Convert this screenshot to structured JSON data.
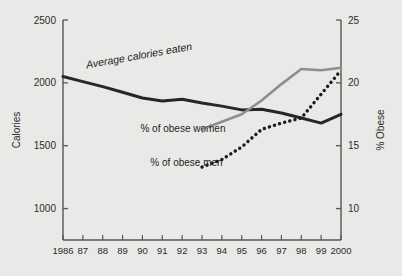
{
  "chart_data": {
    "type": "line",
    "title": "",
    "subtitle": "",
    "xlabel": "",
    "ylabel": "Calories",
    "y2label": "% Obese",
    "grid": false,
    "legend": "inline-annotations",
    "background_color": "#e9e9e7",
    "x": [
      1986,
      1987,
      1988,
      1989,
      1990,
      1991,
      1992,
      1993,
      1994,
      1995,
      1996,
      1997,
      1998,
      1999,
      2000
    ],
    "xtick_labels": [
      "1986",
      "87",
      "88",
      "89",
      "90",
      "91",
      "92",
      "93",
      "94",
      "95",
      "96",
      "97",
      "98",
      "99",
      "2000"
    ],
    "xlim": [
      1986,
      2000
    ],
    "ylim": [
      750,
      2500
    ],
    "ytick_labels": [
      "2500",
      "2000",
      "1500",
      "1000"
    ],
    "yticks": [
      2500,
      2000,
      1500,
      1000
    ],
    "y2lim": [
      7.5,
      25
    ],
    "y2tick_labels": [
      "25",
      "20",
      "15",
      "10"
    ],
    "y2ticks": [
      25,
      20,
      15,
      10
    ],
    "series": [
      {
        "name": "Average calories eaten",
        "axis": "left",
        "style": "solid-thick",
        "color": "#262626",
        "label": "Average calories eaten",
        "x": [
          1986,
          1987,
          1988,
          1989,
          1990,
          1991,
          1992,
          1993,
          1994,
          1995,
          1996,
          1997,
          1998,
          1999,
          2000
        ],
        "values": [
          2050,
          2010,
          1970,
          1925,
          1880,
          1855,
          1870,
          1840,
          1815,
          1785,
          1790,
          1760,
          1720,
          1680,
          1750
        ]
      },
      {
        "name": "% of obese women",
        "axis": "right",
        "style": "solid-gray",
        "color": "#8e8e8e",
        "label": "% of obese women",
        "x": [
          1993,
          1994,
          1995,
          1996,
          1997,
          1998,
          1999,
          2000
        ],
        "values": [
          16.3,
          16.9,
          17.5,
          18.6,
          19.9,
          21.1,
          21.0,
          21.2
        ]
      },
      {
        "name": "% of obese men",
        "axis": "right",
        "style": "dotted",
        "color": "#1c1c1c",
        "label": "% of obese men",
        "x": [
          1993,
          1994,
          1995,
          1996,
          1997,
          1998,
          1999,
          2000
        ],
        "values": [
          13.3,
          13.9,
          14.9,
          16.3,
          16.8,
          17.2,
          19.1,
          21.0
        ]
      }
    ],
    "annotations": [
      {
        "text": "Average calories eaten",
        "x": 1987.2,
        "y": 2115,
        "rotation": -10
      },
      {
        "text": "% of obese women",
        "x": 1989.9,
        "y": 1610,
        "rotation": 0
      },
      {
        "text": "% of obese men",
        "x": 1990.4,
        "y": 1340,
        "rotation": 0
      }
    ]
  }
}
